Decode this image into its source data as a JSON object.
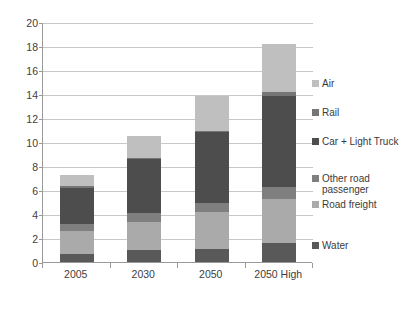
{
  "chart_data": {
    "type": "bar",
    "subtype": "stacked-vertical",
    "title": "",
    "xlabel": "",
    "ylabel": "",
    "categories": [
      "2005",
      "2030",
      "2050",
      "2050 High"
    ],
    "ylim": [
      0,
      20
    ],
    "ytick_labels": [
      "0",
      "2",
      "4",
      "6",
      "8",
      "10",
      "12",
      "14",
      "16",
      "18",
      "20"
    ],
    "ytick_values": [
      0,
      2,
      4,
      6,
      8,
      10,
      12,
      14,
      16,
      18,
      20
    ],
    "grid": true,
    "legend_position": "right",
    "stack_order_bottom_to_top": [
      "Water",
      "Road freight",
      "Other road passenger",
      "Car + Light Truck",
      "Rail",
      "Air"
    ],
    "series": [
      {
        "name": "Water",
        "color": "#595959",
        "values": [
          0.7,
          1.0,
          1.1,
          1.6
        ]
      },
      {
        "name": "Road freight",
        "color": "#aaaaaa",
        "values": [
          1.9,
          2.3,
          3.1,
          3.65
        ]
      },
      {
        "name": "Other road passenger",
        "color": "#7f7f7f",
        "values": [
          0.6,
          0.8,
          0.7,
          1.0
        ]
      },
      {
        "name": "Car + Light Truck",
        "color": "#4d4d4d",
        "values": [
          3.0,
          4.45,
          5.9,
          7.6
        ]
      },
      {
        "name": "Rail",
        "color": "#767676",
        "values": [
          0.1,
          0.15,
          0.15,
          0.3
        ]
      },
      {
        "name": "Air",
        "color": "#bfbfbf",
        "values": [
          0.95,
          1.8,
          2.9,
          4.0
        ]
      }
    ],
    "totals": [
      7.25,
      10.5,
      13.85,
      18.15
    ]
  },
  "legend": {
    "items": [
      {
        "label": "Air",
        "color": "#bfbfbf"
      },
      {
        "label": "Rail",
        "color": "#767676"
      },
      {
        "label": "Car + Light Truck",
        "color": "#4d4d4d"
      },
      {
        "label": "Other road passenger",
        "color": "#7f7f7f"
      },
      {
        "label": "Road freight",
        "color": "#aaaaaa"
      },
      {
        "label": "Water",
        "color": "#595959"
      }
    ]
  },
  "colors": {
    "gridline": "#c8c8c8",
    "axis": "#9a9a9a",
    "text": "#404040",
    "background": "#ffffff"
  }
}
